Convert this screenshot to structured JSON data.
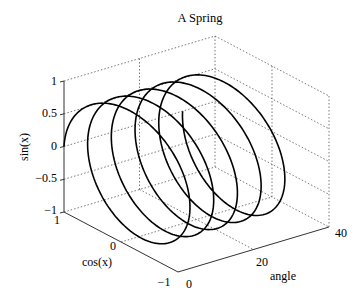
{
  "chart_data": {
    "type": "line3d",
    "title": "A Spring",
    "xlabel": "cos(x)",
    "ylabel": "angle",
    "zlabel": "sin(x)",
    "series": [
      {
        "name": "spring",
        "parametric": {
          "x": "cos(t)",
          "y": "t",
          "z": "sin(t)"
        },
        "t_range": [
          0,
          31.4159
        ],
        "turns": 5,
        "color": "#000000"
      }
    ],
    "xlim": [
      -1,
      1
    ],
    "ylim": [
      0,
      40
    ],
    "zlim": [
      -1,
      1
    ],
    "xticks": [
      "1",
      "0",
      "−1"
    ],
    "yticks": [
      "0",
      "20",
      "40"
    ],
    "zticks": [
      "1",
      "0.5",
      "0",
      "−0.5",
      "−1"
    ],
    "grid": true,
    "box": false
  }
}
